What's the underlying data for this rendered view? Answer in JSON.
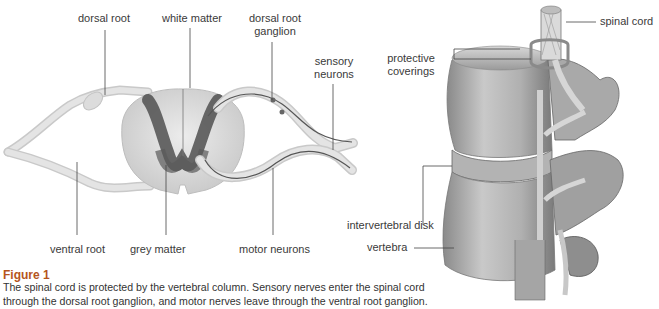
{
  "left_diagram": {
    "labels": {
      "dorsal_root": "dorsal root",
      "white_matter": "white matter",
      "dorsal_root_ganglion_line1": "dorsal root",
      "dorsal_root_ganglion_line2": "ganglion",
      "sensory_neurons_line1": "sensory",
      "sensory_neurons_line2": "neurons",
      "ventral_root": "ventral root",
      "grey_matter": "grey matter",
      "motor_neurons": "motor neurons"
    }
  },
  "right_diagram": {
    "labels": {
      "spinal_cord": "spinal cord",
      "protective_coverings_line1": "protective",
      "protective_coverings_line2": "coverings",
      "intervertebral_disk": "intervertebral disk",
      "vertebra": "vertebra"
    }
  },
  "figure": {
    "title": "Figure 1",
    "caption": "The spinal cord is protected by the vertebral column. Sensory nerves enter the spinal cord through the dorsal root ganglion, and motor nerves leave through the ventral root ganglion."
  },
  "colors": {
    "figure_title": "#b5541c",
    "nerve_fill": "#e2e2e2",
    "grey_matter": "#4a4a4a",
    "bone": "#b9b9b9"
  }
}
